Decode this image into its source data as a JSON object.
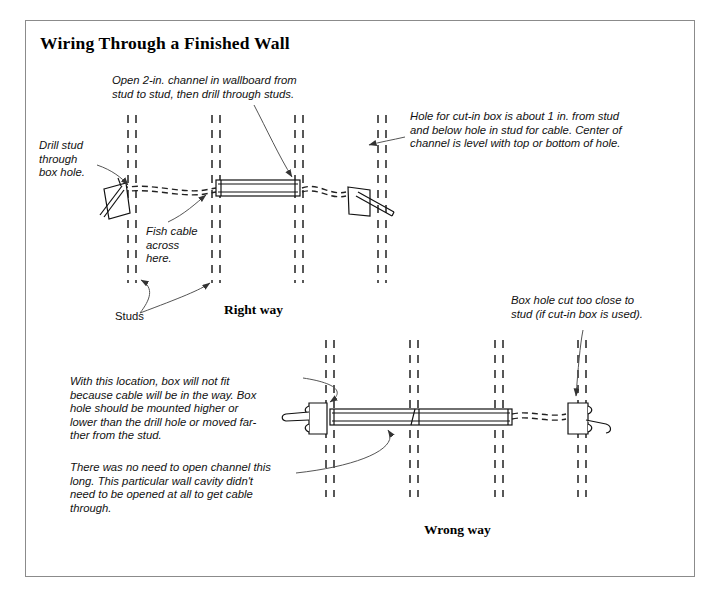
{
  "document": {
    "title": "Wiring Through a Finished Wall",
    "border_color": "#8b8b8b",
    "ink_color": "#111111",
    "background": "#ffffff"
  },
  "captions": {
    "right_way": "Right way",
    "wrong_way": "Wrong way"
  },
  "labels": {
    "studs": "Studs"
  },
  "notes": {
    "open_channel": "Open 2-in. channel in wallboard from\nstud to stud, then drill through studs.",
    "cut_in_box_hole": "Hole for cut-in box is about 1 in. from stud\nand below hole in stud for cable. Center of\nchannel is level with top or bottom of hole.",
    "drill_stud": "Drill stud\nthrough\nbox hole.",
    "fish_cable": "Fish cable\nacross\nhere.",
    "box_hole_too_close": "Box hole cut too close to\nstud (if cut-in box is used).",
    "box_will_not_fit": "With this location, box will not fit\nbecause cable will be in the way. Box\nhole should be mounted higher or\nlower than the drill hole or moved far-\nther from the stud.",
    "no_need_to_open": "There was no need to open channel this\nlong. This particular wall cavity didn't\nneed to be opened at all to get cable\nthrough."
  },
  "diagram": {
    "top": {
      "name": "right-way-wall-section",
      "studs_x": [
        [
          128,
          136
        ],
        [
          212,
          220
        ],
        [
          295,
          303
        ],
        [
          378,
          386
        ]
      ],
      "stud_top": 115,
      "stud_bottom": 283,
      "channel": {
        "x1": 216,
        "x2": 300,
        "y": 181,
        "height": 14
      },
      "cable_y": 189,
      "box_left": {
        "x": 100,
        "y": 185,
        "w": 26,
        "h": 34
      },
      "box_right": {
        "x": 348,
        "y": 188,
        "w": 24,
        "h": 30
      }
    },
    "bottom": {
      "name": "wrong-way-wall-section",
      "studs_x": [
        [
          326,
          334
        ],
        [
          410,
          418
        ],
        [
          495,
          503
        ],
        [
          578,
          586
        ]
      ],
      "stud_top": 340,
      "stud_bottom": 497,
      "channel": {
        "x1": 330,
        "x2": 512,
        "y": 409,
        "height": 16
      },
      "cable_y": 417,
      "box_left": {
        "x": 307,
        "y": 403,
        "w": 24,
        "h": 30
      },
      "box_right": {
        "x": 566,
        "y": 403,
        "w": 24,
        "h": 30
      }
    }
  }
}
